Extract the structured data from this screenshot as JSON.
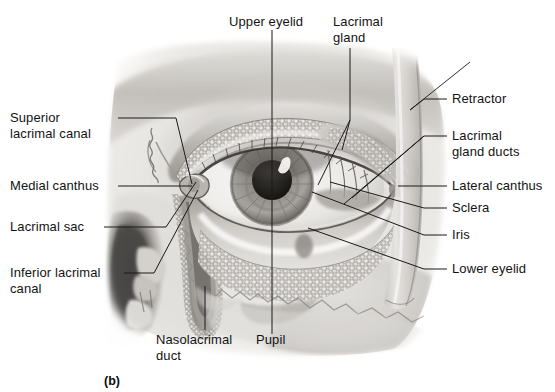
{
  "figure": {
    "panel_letter": "(b)",
    "style": "grayscale-medical-illustration",
    "background_color": "#ffffff",
    "text_color": "#131313",
    "leader_line_color": "#1a1a1a"
  },
  "labels": {
    "upper_eyelid": "Upper eyelid",
    "lacrimal_gland_line1": "Lacrimal",
    "lacrimal_gland_line2": "gland",
    "retractor": "Retractor",
    "lacrimal_gland_ducts_line1": "Lacrimal",
    "lacrimal_gland_ducts_line2": "gland ducts",
    "lateral_canthus": "Lateral canthus",
    "sclera": "Sclera",
    "iris": "Iris",
    "lower_eyelid": "Lower eyelid",
    "superior_lacrimal_canal_line1": "Superior",
    "superior_lacrimal_canal_line2": "lacrimal canal",
    "medial_canthus": "Medial canthus",
    "lacrimal_sac": "Lacrimal sac",
    "inferior_lacrimal_canal_line1": "Inferior lacrimal",
    "inferior_lacrimal_canal_line2": "canal",
    "nasolacrimal_duct_line1": "Nasolacrimal",
    "nasolacrimal_duct_line2": "duct",
    "pupil": "Pupil"
  }
}
